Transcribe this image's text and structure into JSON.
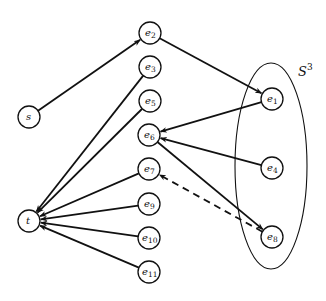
{
  "diagram": {
    "type": "directed-graph",
    "set": {
      "label": "S",
      "superscript": "3",
      "contains": [
        "e1",
        "e4",
        "e8"
      ]
    },
    "nodes": [
      {
        "id": "s",
        "base": "s",
        "sub": "",
        "x": 29,
        "y": 117
      },
      {
        "id": "t",
        "base": "t",
        "sub": "",
        "x": 29,
        "y": 221
      },
      {
        "id": "e2",
        "base": "e",
        "sub": "2",
        "x": 150,
        "y": 33
      },
      {
        "id": "e3",
        "base": "e",
        "sub": "3",
        "x": 150,
        "y": 67
      },
      {
        "id": "e5",
        "base": "e",
        "sub": "5",
        "x": 150,
        "y": 101
      },
      {
        "id": "e6",
        "base": "e",
        "sub": "6",
        "x": 149,
        "y": 135
      },
      {
        "id": "e7",
        "base": "e",
        "sub": "7",
        "x": 149,
        "y": 169
      },
      {
        "id": "e9",
        "base": "e",
        "sub": "9",
        "x": 149,
        "y": 204
      },
      {
        "id": "e10",
        "base": "e",
        "sub": "10",
        "x": 149,
        "y": 238
      },
      {
        "id": "e11",
        "base": "e",
        "sub": "11",
        "x": 149,
        "y": 272
      },
      {
        "id": "e1",
        "base": "e",
        "sub": "1",
        "x": 272,
        "y": 99
      },
      {
        "id": "e4",
        "base": "e",
        "sub": "4",
        "x": 272,
        "y": 168
      },
      {
        "id": "e8",
        "base": "e",
        "sub": "8",
        "x": 272,
        "y": 237
      }
    ],
    "edges": [
      {
        "from": "s",
        "to": "e2",
        "style": "solid"
      },
      {
        "from": "e2",
        "to": "e1",
        "style": "solid"
      },
      {
        "from": "e1",
        "to": "e6",
        "style": "solid"
      },
      {
        "from": "e4",
        "to": "e6",
        "style": "solid"
      },
      {
        "from": "e6",
        "to": "e8",
        "style": "solid"
      },
      {
        "from": "e8",
        "to": "e7",
        "style": "dashed"
      },
      {
        "from": "e3",
        "to": "t",
        "style": "solid"
      },
      {
        "from": "e5",
        "to": "t",
        "style": "solid"
      },
      {
        "from": "e7",
        "to": "t",
        "style": "solid"
      },
      {
        "from": "e9",
        "to": "t",
        "style": "solid"
      },
      {
        "from": "e10",
        "to": "t",
        "style": "solid"
      },
      {
        "from": "e11",
        "to": "t",
        "style": "solid"
      }
    ]
  }
}
